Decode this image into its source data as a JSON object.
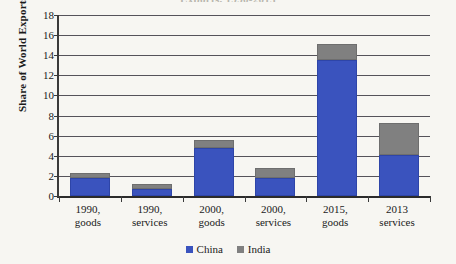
{
  "chart_data": {
    "type": "bar",
    "stacked": true,
    "title": "Exports, 1990-2015",
    "xlabel": "",
    "ylabel": "Share of World Exports",
    "ylim": [
      0,
      18
    ],
    "ytick_step": 2,
    "yticks": [
      "18",
      "16",
      "14",
      "12",
      "10",
      "8",
      "6",
      "4",
      "2",
      "0"
    ],
    "grid": true,
    "legend_position": "bottom",
    "categories": [
      [
        "1990,",
        "goods"
      ],
      [
        "1990,",
        "services"
      ],
      [
        "2000,",
        "goods"
      ],
      [
        "2000,",
        "services"
      ],
      [
        "2015,",
        "goods"
      ],
      [
        "2013",
        "services"
      ]
    ],
    "series": [
      {
        "name": "China",
        "color": "#3a53be",
        "values": [
          1.8,
          0.7,
          4.8,
          1.8,
          13.5,
          4.1
        ]
      },
      {
        "name": "India",
        "color": "#808080",
        "values": [
          0.5,
          0.5,
          0.8,
          1.0,
          1.6,
          3.2
        ]
      }
    ],
    "totals": [
      2.3,
      1.2,
      5.6,
      2.8,
      15.1,
      7.3
    ]
  },
  "legend": {
    "items": [
      {
        "label": "China",
        "color": "#3a53be"
      },
      {
        "label": "India",
        "color": "#808080"
      }
    ]
  }
}
